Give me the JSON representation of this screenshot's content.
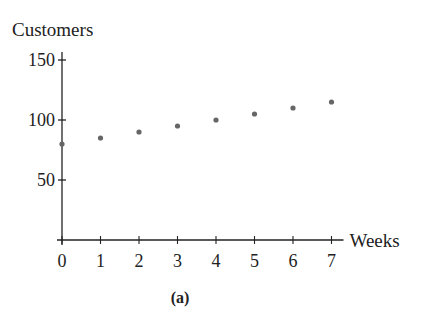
{
  "chart_data": {
    "type": "scatter",
    "title": "",
    "caption": "(a)",
    "xlabel": "Weeks",
    "ylabel": "Customers",
    "x": [
      0,
      1,
      2,
      3,
      4,
      5,
      6,
      7
    ],
    "values": [
      80,
      85,
      90,
      95,
      100,
      105,
      110,
      115
    ],
    "x_ticks": [
      "0",
      "1",
      "2",
      "3",
      "4",
      "5",
      "6",
      "7"
    ],
    "y_ticks": [
      "50",
      "100",
      "150"
    ],
    "xlim": [
      0,
      7
    ],
    "ylim": [
      0,
      150
    ],
    "grid": false,
    "legend": null,
    "point_color": "#666666",
    "axis_color": "#222222"
  }
}
